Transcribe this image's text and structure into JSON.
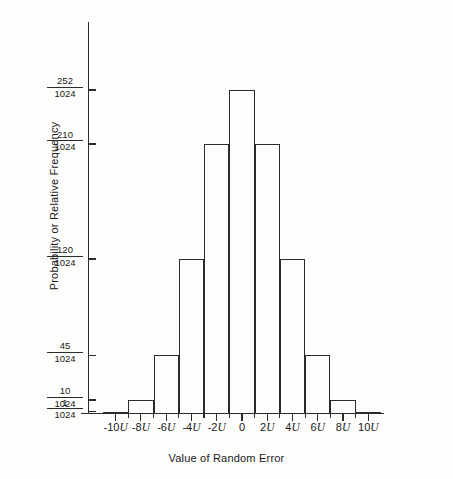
{
  "chart_data": {
    "type": "bar",
    "title": "",
    "subtitle": "",
    "xlabel": "Value of Random Error",
    "ylabel": "Probability or Relative Frequency",
    "categories": [
      "-10U",
      "-8U",
      "-6U",
      "-4U",
      "-2U",
      "0",
      "2U",
      "4U",
      "6U",
      "8U",
      "10U"
    ],
    "values": [
      1,
      10,
      45,
      120,
      210,
      252,
      210,
      120,
      45,
      10,
      1
    ],
    "value_denominator": 1024,
    "values_as_fractions": [
      "1/1024",
      "10/1024",
      "45/1024",
      "120/1024",
      "210/1024",
      "252/1024",
      "210/1024",
      "120/1024",
      "45/1024",
      "10/1024",
      "1/1024"
    ],
    "ylim": [
      0,
      270
    ],
    "xlim": [
      -11,
      11
    ],
    "grid": false,
    "legend": null,
    "y_tick_values": [
      1,
      10,
      45,
      120,
      210,
      252
    ],
    "y_tick_labels": [
      {
        "numerator": "1",
        "denominator": "1024",
        "value": 1
      },
      {
        "numerator": "10",
        "denominator": "1024",
        "value": 10
      },
      {
        "numerator": "45",
        "denominator": "1024",
        "value": 45
      },
      {
        "numerator": "120",
        "denominator": "1024",
        "value": 120
      },
      {
        "numerator": "210",
        "denominator": "1024",
        "value": 210
      },
      {
        "numerator": "252",
        "denominator": "1024",
        "value": 252
      }
    ],
    "x_tick_labels": [
      {
        "prefix": "-10",
        "unit": "U",
        "value": -10
      },
      {
        "prefix": "-8",
        "unit": "U",
        "value": -8
      },
      {
        "prefix": "-6",
        "unit": "U",
        "value": -6
      },
      {
        "prefix": "-4",
        "unit": "U",
        "value": -4
      },
      {
        "prefix": "-2",
        "unit": "U",
        "value": -2
      },
      {
        "prefix": "0",
        "unit": "",
        "value": 0
      },
      {
        "prefix": "2",
        "unit": "U",
        "value": 2
      },
      {
        "prefix": "4",
        "unit": "U",
        "value": 4
      },
      {
        "prefix": "6",
        "unit": "U",
        "value": 6
      },
      {
        "prefix": "8",
        "unit": "U",
        "value": 8
      },
      {
        "prefix": "10",
        "unit": "U",
        "value": 10
      }
    ],
    "colors": {
      "axis": "#2b2b2b",
      "bar_stroke": "#2b2b2b",
      "bar_fill": "transparent",
      "background": "#fdfdfc",
      "text": "#1a1a1a"
    }
  },
  "axes": {
    "y_title": "Probability or Relative Frequency",
    "x_title": "Value of Random Error"
  }
}
